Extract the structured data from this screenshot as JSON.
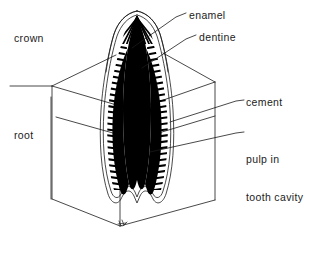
{
  "figure": {
    "background_color": "#ffffff",
    "ink_color": "#1b1b1b",
    "pulp_fill_color": "#000000"
  },
  "labels": {
    "crown": "crown",
    "root": "root",
    "enamel": "enamel",
    "dentine": "dentine",
    "cement": "cement",
    "pulp_line1": "pulp in",
    "pulp_line2": "tooth cavity"
  },
  "parts": {
    "jaw_block": "jaw-block",
    "tooth_crown": "tooth-crown",
    "tooth_root": "tooth-root",
    "enamel_layer": "enamel-layer",
    "dentine_layer": "dentine-layer",
    "pulp_cavity": "pulp-cavity",
    "cement_layer": "cement-layer"
  },
  "artist_mark": "artist-signature-mark"
}
